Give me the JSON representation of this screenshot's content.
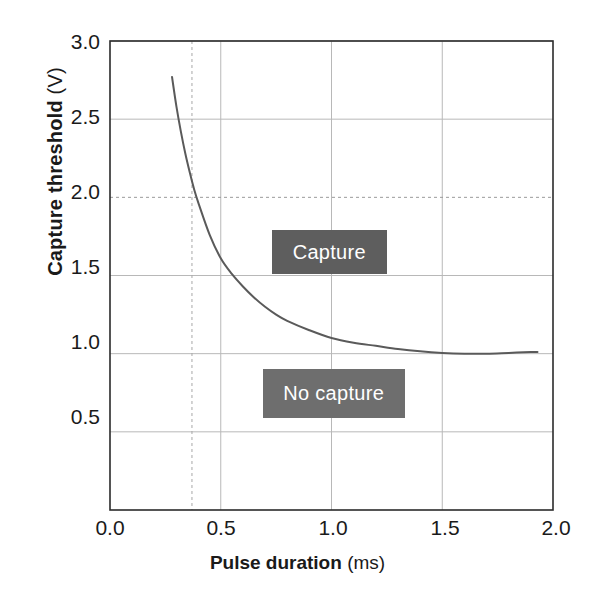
{
  "chart_data": {
    "type": "line",
    "title": "",
    "xlabel_bold": "Pulse duration",
    "xlabel_unit": "(ms)",
    "ylabel_bold": "Capture threshold",
    "ylabel_unit": "(V)",
    "xlim": [
      0.0,
      2.0
    ],
    "ylim": [
      0.0,
      3.0
    ],
    "xticks": [
      "0.0",
      "0.5",
      "1.0",
      "1.5",
      "2.0"
    ],
    "xtick_values": [
      0.0,
      0.5,
      1.0,
      1.5,
      2.0
    ],
    "yticks": [
      "0.5",
      "1.0",
      "1.5",
      "2.0",
      "2.5",
      "3.0"
    ],
    "ytick_values": [
      0.5,
      1.0,
      1.5,
      2.0,
      2.5,
      3.0
    ],
    "grid": "both axes, light gray solid; the 2.0 V horizontal line and the 0.37 ms vertical line are dotted",
    "legend": "none",
    "series": [
      {
        "name": "Strength-duration curve",
        "color": "#5a5a5a",
        "x": [
          0.28,
          0.3,
          0.32,
          0.34,
          0.36,
          0.38,
          0.4,
          0.45,
          0.5,
          0.55,
          0.6,
          0.65,
          0.7,
          0.75,
          0.8,
          0.9,
          1.0,
          1.1,
          1.2,
          1.3,
          1.4,
          1.5,
          1.6,
          1.7,
          1.8,
          1.9,
          1.93
        ],
        "y": [
          2.77,
          2.58,
          2.42,
          2.28,
          2.16,
          2.05,
          1.96,
          1.76,
          1.61,
          1.51,
          1.43,
          1.36,
          1.3,
          1.25,
          1.21,
          1.15,
          1.1,
          1.07,
          1.05,
          1.03,
          1.015,
          1.005,
          1.0,
          1.0,
          1.005,
          1.01,
          1.01
        ]
      }
    ],
    "annotations": [
      {
        "label": "Capture",
        "box_color": "#5e5e5e",
        "text_color": "#ffffff",
        "x_range": [
          0.73,
          1.25
        ],
        "y_range": [
          1.51,
          1.79
        ]
      },
      {
        "label": "No capture",
        "box_color": "#6e6e6e",
        "text_color": "#ffffff",
        "x_range": [
          0.69,
          1.33
        ],
        "y_range": [
          0.59,
          0.9
        ]
      }
    ],
    "dotted_vertical_line_x": 0.37,
    "dotted_horizontal_line_y": 2.0
  },
  "colors": {
    "axis": "#2b2b2b",
    "grid": "#b8b8b8",
    "curve": "#5a5a5a",
    "capture_box": "#5e5e5e",
    "no_capture_box": "#6e6e6e",
    "background": "#ffffff"
  }
}
